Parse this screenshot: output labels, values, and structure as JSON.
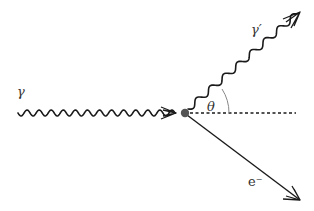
{
  "diagram": {
    "colors": {
      "line": "#1a1a1a",
      "vertex": "#555555",
      "arc": "#888888",
      "label": "#333333"
    },
    "labels": {
      "incoming_photon": "γ",
      "scattered_photon": "γ′",
      "angle": "θ",
      "electron": "e⁻"
    },
    "nodes": [
      {
        "id": "vertex",
        "type": "interaction-point",
        "x": 185,
        "y": 113
      }
    ],
    "edges": [
      {
        "id": "incoming-photon",
        "style": "wavy",
        "from": [
          18,
          113
        ],
        "to": "vertex",
        "label": "γ",
        "arrow": "end"
      },
      {
        "id": "scattered-photon",
        "style": "wavy",
        "from": "vertex",
        "to": [
          300,
          12
        ],
        "label": "γ′",
        "arrow": "end"
      },
      {
        "id": "recoil-electron",
        "style": "solid",
        "from": "vertex",
        "to": [
          300,
          200
        ],
        "label": "e⁻",
        "arrow": "end"
      },
      {
        "id": "reference-axis",
        "style": "dashed",
        "from": "vertex",
        "to": [
          296,
          113
        ]
      }
    ],
    "angle": {
      "label": "θ",
      "between": [
        "reference-axis",
        "scattered-photon"
      ]
    }
  }
}
